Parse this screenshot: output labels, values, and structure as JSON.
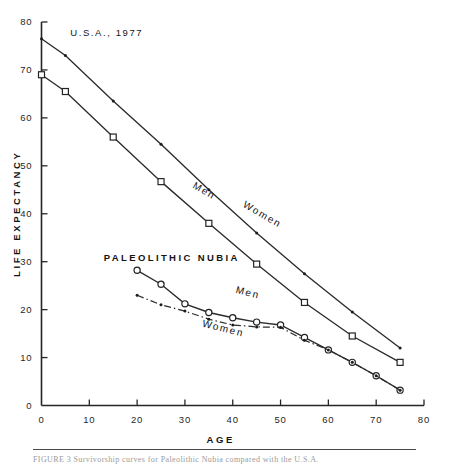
{
  "figure": {
    "caption_fragment": "FIGURE 3  Survivorship curves for Paleolithic Nubia compared with the U.S.A."
  },
  "chart_data": {
    "type": "line",
    "title": "",
    "xlabel": "AGE",
    "ylabel": "LIFE EXPECTANCY",
    "xlim": [
      0,
      80
    ],
    "ylim": [
      0,
      80
    ],
    "xticks": [
      0,
      10,
      20,
      30,
      40,
      50,
      60,
      70,
      80
    ],
    "xticklabels": [
      "0",
      "10",
      "20",
      "30",
      "40",
      "50",
      "60",
      "70",
      "80"
    ],
    "yticks": [
      0,
      10,
      20,
      30,
      40,
      50,
      60,
      70,
      80
    ],
    "yticklabels": [
      "0",
      "10",
      "20",
      "30",
      "40",
      "50",
      "60",
      "70",
      "80"
    ],
    "grid": false,
    "legend": "inline-annotations",
    "annotations": [
      {
        "text": "U.S.A., 1977",
        "x": 6,
        "y": 78
      },
      {
        "text": "PALEOLITHIC  NUBIA",
        "x": 13,
        "y": 31
      }
    ],
    "series": [
      {
        "name": "U.S.A. 1977 Women",
        "label": "Women",
        "marker": "dot",
        "linestyle": "solid",
        "color": "#2b2b2b",
        "x": [
          0,
          5,
          15,
          25,
          35,
          45,
          55,
          65,
          75
        ],
        "y": [
          76.5,
          73.0,
          63.5,
          54.5,
          45.0,
          36.0,
          27.5,
          19.5,
          12.0
        ]
      },
      {
        "name": "U.S.A. 1977 Men",
        "label": "Men",
        "marker": "square",
        "linestyle": "solid",
        "color": "#2b2b2b",
        "x": [
          0,
          5,
          15,
          25,
          35,
          45,
          55,
          65,
          75
        ],
        "y": [
          69.0,
          65.5,
          56.0,
          46.7,
          38.0,
          29.5,
          21.5,
          14.5,
          9.0
        ]
      },
      {
        "name": "Paleolithic Nubia Men",
        "label": "Men",
        "marker": "circle",
        "linestyle": "solid",
        "color": "#2b2b2b",
        "x": [
          20,
          25,
          30,
          35,
          40,
          45,
          50,
          55,
          60,
          65,
          70,
          75
        ],
        "y": [
          28.2,
          25.3,
          21.2,
          19.4,
          18.3,
          17.4,
          16.8,
          14.2,
          11.6,
          9.0,
          6.2,
          3.2
        ]
      },
      {
        "name": "Paleolithic Nubia Women",
        "label": "Women",
        "marker": "dot",
        "linestyle": "dashdot",
        "color": "#2b2b2b",
        "x": [
          20,
          25,
          30,
          35,
          40,
          45,
          50,
          55,
          60,
          65,
          70,
          75
        ],
        "y": [
          23.0,
          21.0,
          19.7,
          18.0,
          16.8,
          16.4,
          16.3,
          13.6,
          11.6,
          9.0,
          6.2,
          3.2
        ]
      }
    ]
  }
}
